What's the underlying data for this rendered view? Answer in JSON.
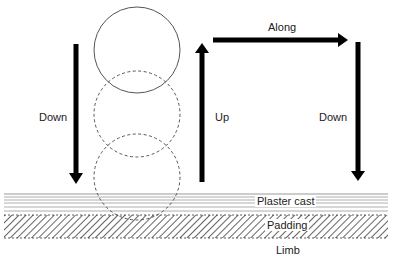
{
  "diagram": {
    "type": "cast-application-technique",
    "labels": {
      "down_left": "Down",
      "up": "Up",
      "along": "Along",
      "down_right": "Down",
      "plaster_cast": "Plaster cast",
      "padding": "Padding",
      "limb": "Limb"
    },
    "circles": [
      {
        "id": "position-1",
        "style": "solid",
        "cx": 137,
        "cy": 50,
        "r": 43
      },
      {
        "id": "position-2",
        "style": "dashed",
        "cx": 137,
        "cy": 114,
        "r": 43
      },
      {
        "id": "position-3",
        "style": "dashed",
        "cx": 137,
        "cy": 177,
        "r": 43
      }
    ],
    "arrows": [
      {
        "id": "down-left",
        "direction": "down",
        "label": "Down"
      },
      {
        "id": "up",
        "direction": "up",
        "label": "Up"
      },
      {
        "id": "along",
        "direction": "right",
        "label": "Along"
      },
      {
        "id": "down-right",
        "direction": "down",
        "label": "Down"
      }
    ],
    "layers": [
      "Plaster cast",
      "Padding",
      "Limb"
    ],
    "colors": {
      "arrow": "#000000",
      "circle_stroke": "#555555",
      "cast_line": "#888888",
      "hatch": "#222222"
    }
  }
}
